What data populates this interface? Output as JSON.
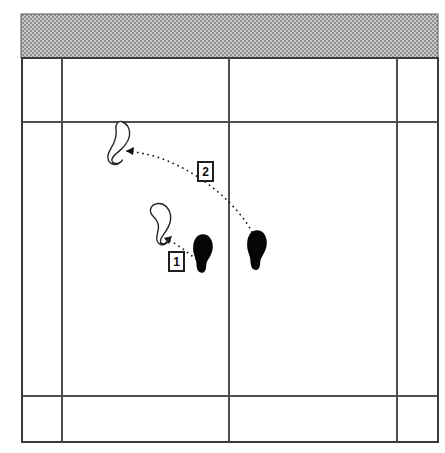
{
  "diagram": {
    "canvas": {
      "width": 445,
      "height": 453,
      "background": "#ffffff"
    },
    "colors": {
      "grid_line": "#4d4d4d",
      "outer_border": "#3a3a3a",
      "shade_fill": "#a8a8a8",
      "foot_solid": "#050505",
      "foot_outline_stroke": "#262626",
      "path_stroke": "#1a1a1a",
      "label_text": "#0d0d0d",
      "label_box_fill": "#ffffff"
    },
    "shaded_band": {
      "name": "top-shaded-band",
      "pattern": "stipple",
      "fill": "#a8a8a8",
      "x": 21,
      "y": 14,
      "width": 417,
      "height": 44
    },
    "grid": {
      "outer": {
        "x": 22,
        "y": 58,
        "width": 416,
        "height": 384
      },
      "vertical_lines": [
        62,
        229,
        397
      ],
      "horizontal_lines": [
        122,
        396
      ]
    },
    "footprints": [
      {
        "id": "solid-foot-left",
        "name": "solid-footprint-left",
        "style": "solid",
        "side": "right",
        "x": 193,
        "y": 234,
        "width": 20,
        "height": 39
      },
      {
        "id": "solid-foot-right",
        "name": "solid-footprint-right",
        "style": "solid",
        "side": "right",
        "x": 247,
        "y": 230,
        "width": 20,
        "height": 40
      },
      {
        "id": "outline-foot-lower",
        "name": "outline-footprint-lower",
        "style": "outline",
        "side": "left",
        "x": 147,
        "y": 203,
        "width": 25,
        "height": 41
      },
      {
        "id": "outline-foot-upper",
        "name": "outline-footprint-upper",
        "style": "outline",
        "side": "left",
        "x": 106,
        "y": 121,
        "width": 25,
        "height": 43
      }
    ],
    "paths": [
      {
        "id": "path-1",
        "name": "movement-path-1",
        "label": "1",
        "from": "solid-foot-left",
        "to": "outline-foot-lower",
        "style": "dotted",
        "label_x": 176,
        "label_y": 262
      },
      {
        "id": "path-2",
        "name": "movement-path-2",
        "label": "2",
        "from": "solid-foot-right",
        "to": "outline-foot-upper",
        "style": "dotted",
        "label_x": 205,
        "label_y": 172
      }
    ],
    "labels": [
      {
        "name": "step-label-1",
        "text": "1"
      },
      {
        "name": "step-label-2",
        "text": "2"
      }
    ]
  }
}
